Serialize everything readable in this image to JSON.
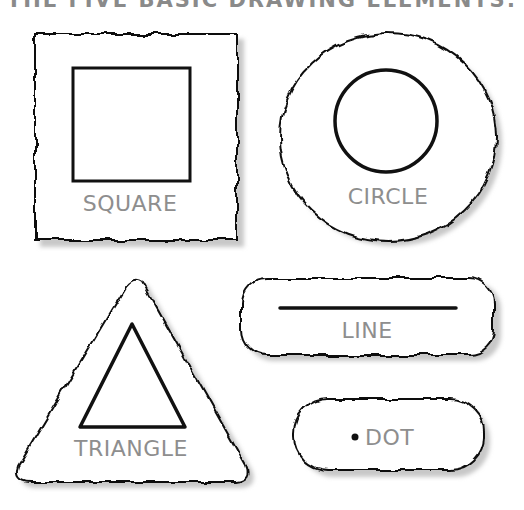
{
  "title": "THE FIVE BASIC DRAWING ELEMENTS:",
  "colors": {
    "background": "#ffffff",
    "outline": "#111111",
    "shadow": "#c8c8c8",
    "label": "#8e8e8e"
  },
  "elements": [
    {
      "id": "square",
      "label": "SQUARE",
      "shape": "square"
    },
    {
      "id": "circle",
      "label": "CIRCLE",
      "shape": "circle"
    },
    {
      "id": "line",
      "label": "LINE",
      "shape": "line"
    },
    {
      "id": "triangle",
      "label": "TRIANGLE",
      "shape": "triangle"
    },
    {
      "id": "dot",
      "label": "DOT",
      "shape": "dot"
    }
  ]
}
